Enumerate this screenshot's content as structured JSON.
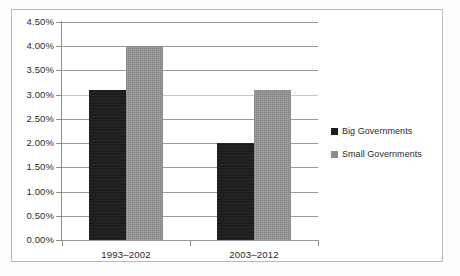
{
  "chart_data": {
    "type": "bar",
    "title": "",
    "subtitle": "",
    "xlabel": "",
    "ylabel": "",
    "categories": [
      "1993–2002",
      "2003–2012"
    ],
    "series": [
      {
        "name": "Big Governments",
        "color": "#1d1d1d",
        "values": [
          3.1,
          2.0
        ]
      },
      {
        "name": "Small Governments",
        "color": "#8b8b8b",
        "values": [
          4.0,
          3.1
        ]
      }
    ],
    "ylim": [
      0,
      4.5
    ],
    "ytick_values": [
      0.0,
      0.5,
      1.0,
      1.5,
      2.0,
      2.5,
      3.0,
      3.5,
      4.0,
      4.5
    ],
    "ytick_labels": [
      "0.00%",
      "0.50%",
      "1.00%",
      "1.50%",
      "2.00%",
      "2.50%",
      "3.00%",
      "3.50%",
      "4.00%",
      "4.50%"
    ],
    "value_format": "percent",
    "grid": true,
    "grid_axis": "y",
    "legend_position": "right",
    "legend": [
      "Big Governments",
      "Small Governments"
    ]
  },
  "colors": {
    "big_governments": "#1d1d1d",
    "small_governments": "#8b8b8b",
    "gridline": "#9a9a9a",
    "axis": "#8d8d8d",
    "frame_border": "#b9b9b9",
    "text": "#2b2b2b",
    "background": "#ffffff"
  }
}
